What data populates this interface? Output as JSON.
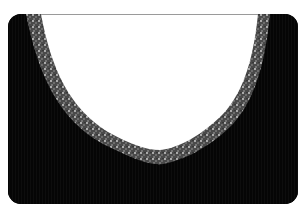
{
  "image": {
    "subject": "black knit garment neckline with sparkly trim",
    "colors": {
      "fabric": "#050505",
      "trim": "#7a7a7a",
      "trim_highlight": "#cfcfcf",
      "opening": "#ffffff",
      "background": "#ffffff"
    }
  }
}
